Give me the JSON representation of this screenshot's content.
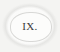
{
  "chapter": {
    "number": "IX.",
    "ornament": "decorative-oval-frame"
  }
}
